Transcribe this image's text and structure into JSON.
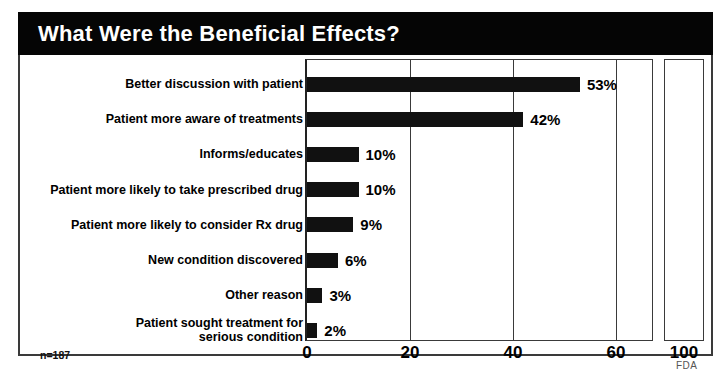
{
  "title": "What Were the Beneficial Effects?",
  "footer": {
    "source_label": "FDA",
    "sample_note": "n=187"
  },
  "chart_data": {
    "type": "bar",
    "orientation": "horizontal",
    "title": "What Were the Beneficial Effects?",
    "xlabel": "",
    "ylabel": "",
    "xlim": [
      0,
      100
    ],
    "axis_break": {
      "present": true,
      "visible_range_end": 66,
      "resumes_at": 96,
      "note": "x-axis is broken between the 60-region box and a separate segment containing the 100 tick"
    },
    "xticks": [
      0,
      20,
      40,
      60,
      100
    ],
    "xtick_labels": [
      "0",
      "20",
      "40",
      "60",
      "100"
    ],
    "grid": true,
    "legend": null,
    "value_suffix": "%",
    "sample_size": 187,
    "sample_note": "n=187",
    "categories": [
      "Better discussion with patient",
      "Patient more aware of treatments",
      "Informs/educates",
      "Patient more likely to take prescribed drug",
      "Patient more likely to consider Rx drug",
      "New condition discovered",
      "Other reason",
      "Patient sought treatment for serious condition"
    ],
    "values": [
      53,
      42,
      10,
      10,
      9,
      6,
      3,
      2
    ],
    "data_labels": [
      "53%",
      "42%",
      "10%",
      "10%",
      "9%",
      "6%",
      "3%",
      "2%"
    ],
    "bar_color": "#111111"
  },
  "rows": [
    {
      "label_line1": "Better discussion with patient",
      "label_line2": "",
      "value": 53,
      "data_label": "53%"
    },
    {
      "label_line1": "Patient more aware of treatments",
      "label_line2": "",
      "value": 42,
      "data_label": "42%"
    },
    {
      "label_line1": "Informs/educates",
      "label_line2": "",
      "value": 10,
      "data_label": "10%"
    },
    {
      "label_line1": "Patient more likely to take prescribed drug",
      "label_line2": "",
      "value": 10,
      "data_label": "10%"
    },
    {
      "label_line1": "Patient more likely to consider Rx drug",
      "label_line2": "",
      "value": 9,
      "data_label": "9%"
    },
    {
      "label_line1": "New condition discovered",
      "label_line2": "",
      "value": 6,
      "data_label": "6%"
    },
    {
      "label_line1": "Other reason",
      "label_line2": "",
      "value": 3,
      "data_label": "3%"
    },
    {
      "label_line1": "Patient sought treatment for",
      "label_line2": "serious condition",
      "value": 2,
      "data_label": "2%"
    }
  ],
  "xticks": [
    {
      "label": "0",
      "value": 0
    },
    {
      "label": "20",
      "value": 20
    },
    {
      "label": "40",
      "value": 40
    },
    {
      "label": "60",
      "value": 60
    },
    {
      "label": "100",
      "value": 100
    }
  ],
  "colors": {
    "title_bar_background": "#050505",
    "title_text": "#ffffff",
    "bar": "#111111",
    "frame": "#3a3a3a",
    "page_background": "#ffffff"
  }
}
